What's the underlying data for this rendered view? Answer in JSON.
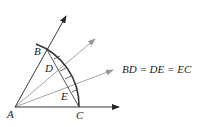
{
  "diagram": {
    "type": "geometric-construction",
    "points": {
      "A": {
        "label": "A",
        "x": 15,
        "y": 107
      },
      "B": {
        "label": "B",
        "x": 46,
        "y": 47
      },
      "C": {
        "label": "C",
        "x": 79,
        "y": 107
      },
      "D": {
        "label": "D",
        "x": 56,
        "y": 68
      },
      "E": {
        "label": "E",
        "x": 70,
        "y": 91
      }
    },
    "rays": [
      {
        "name": "ray-AB",
        "from": "A",
        "to": [
          66,
          16
        ],
        "color": "#222222"
      },
      {
        "name": "ray-AD",
        "from": "A",
        "to": [
          95,
          39
        ],
        "color": "#999999"
      },
      {
        "name": "ray-AE",
        "from": "A",
        "to": [
          113,
          70
        ],
        "color": "#999999"
      },
      {
        "name": "ray-AC",
        "from": "A",
        "to": [
          119,
          107
        ],
        "color": "#222222"
      }
    ],
    "equation": "BD = DE = EC",
    "colors": {
      "primary": "#222222",
      "secondary": "#999999",
      "background": "#ffffff"
    }
  }
}
